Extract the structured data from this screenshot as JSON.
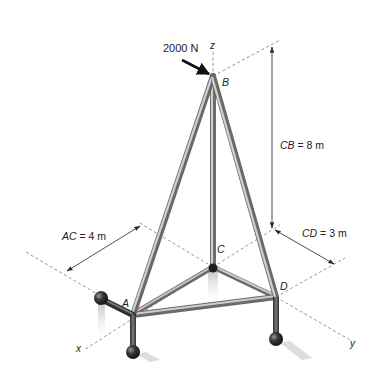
{
  "figure": {
    "load": {
      "label": "2000 N"
    },
    "points": {
      "A": "A",
      "B": "B",
      "C": "C",
      "D": "D"
    },
    "axes": {
      "x": "x",
      "y": "y",
      "z": "z"
    },
    "dimensions": {
      "AC": {
        "name": "AC",
        "value": "= 4 m"
      },
      "CB": {
        "name": "CB",
        "value": "= 8 m"
      },
      "CD": {
        "name": "CD",
        "value": "= 3 m"
      }
    },
    "colors": {
      "member_light": "#c8c8c8",
      "member_mid": "#9a9a9a",
      "member_dark": "#5a5a5a",
      "support_ball": "#2a2a2a",
      "dashed_line": "#8a8a8a",
      "text": "#222222"
    }
  }
}
